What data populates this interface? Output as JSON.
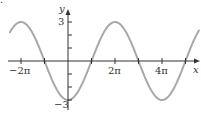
{
  "chart_data": {
    "type": "line",
    "title": "",
    "function": "y = -3 cos(x/2)",
    "xlabel": "x",
    "ylabel": "y",
    "x_tick_labels": [
      "−2π",
      "2π",
      "4π"
    ],
    "x_tick_values_in_pi": [
      -2,
      -1,
      1,
      2,
      3,
      4,
      5
    ],
    "y_tick_labels": [
      "3",
      "−3"
    ],
    "y_tick_values": [
      -3,
      -2,
      -1,
      1,
      2,
      3
    ],
    "xlim_in_pi": [
      -2.47,
      5.57
    ],
    "ylim": [
      -3.6,
      3.9
    ],
    "amplitude": 3,
    "period_in_pi": 4,
    "grid": false,
    "legend": null,
    "series": [
      {
        "name": "y = -3cos(x/2)",
        "x_in_pi": [
          -2.47,
          -2,
          -1,
          0,
          1,
          2,
          3,
          4,
          5,
          5.57
        ],
        "values": [
          2.2,
          3,
          0,
          -3,
          0,
          3,
          0,
          -3,
          0,
          2.37
        ]
      }
    ],
    "colors": {
      "curve": "#a8a8a8",
      "axes": "#333333",
      "text": "#333333"
    }
  },
  "labels": {
    "x_axis": "x",
    "y_axis": "y",
    "x_neg2pi": "−2π",
    "x_2pi": "2π",
    "x_4pi": "4π",
    "y_pos3": "3",
    "y_neg3": "−3",
    "corner_mark": "."
  }
}
